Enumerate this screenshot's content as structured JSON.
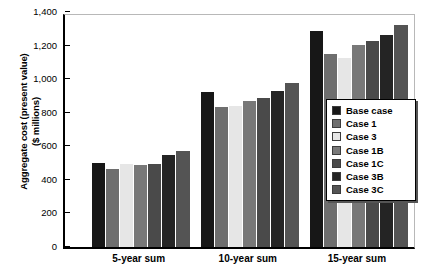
{
  "chart_data": {
    "type": "bar",
    "title": "",
    "xlabel": "",
    "ylabel": "Aggregate cost (present value)\n($ millions)",
    "ylabel_line1": "Aggregate cost (present value)",
    "ylabel_line2": "($ millions)",
    "categories": [
      "5-year sum",
      "10-year sum",
      "15-year sum"
    ],
    "ylim": [
      0,
      1400
    ],
    "yticks": [
      0,
      200,
      400,
      600,
      800,
      1000,
      1200,
      1400
    ],
    "ytick_labels": [
      "0",
      "200",
      "400",
      "600",
      "800",
      "1,000",
      "1,200",
      "1,400"
    ],
    "grid": false,
    "legend_position": "inside-right",
    "series": [
      {
        "name": "Base case",
        "color": "#171717",
        "values": [
          500,
          922,
          1285
        ]
      },
      {
        "name": "Case 1",
        "color": "#6e6e6e",
        "values": [
          467,
          835,
          1150
        ]
      },
      {
        "name": "Case 3",
        "color": "#e6e6e6",
        "values": [
          495,
          838,
          1128
        ]
      },
      {
        "name": "Case 1B",
        "color": "#787878",
        "values": [
          487,
          870,
          1203
        ]
      },
      {
        "name": "Case 1C",
        "color": "#4a4a4a",
        "values": [
          495,
          885,
          1225
        ]
      },
      {
        "name": "Case 3B",
        "color": "#242424",
        "values": [
          548,
          932,
          1265
        ]
      },
      {
        "name": "Case 3C",
        "color": "#545454",
        "values": [
          572,
          978,
          1320
        ]
      }
    ]
  },
  "legend": {
    "items": [
      {
        "label": "Base case",
        "color": "#171717"
      },
      {
        "label": "Case 1",
        "color": "#6e6e6e"
      },
      {
        "label": "Case 3",
        "color": "#e6e6e6"
      },
      {
        "label": "Case 1B",
        "color": "#787878"
      },
      {
        "label": "Case 1C",
        "color": "#4a4a4a"
      },
      {
        "label": "Case 3B",
        "color": "#242424"
      },
      {
        "label": "Case 3C",
        "color": "#545454"
      }
    ]
  }
}
